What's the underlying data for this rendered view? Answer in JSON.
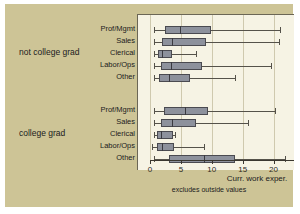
{
  "background_colors": {
    "slide": "#cdc496",
    "panel": "#f6f3e4",
    "box_fill": "#8d919c",
    "box_edge": "#4a4a50",
    "grid": "#cfc9ae",
    "axis": "#3a3730"
  },
  "groups": [
    {
      "label": "not college grad"
    },
    {
      "label": "college grad"
    }
  ],
  "categories": [
    "Prof/Mgmt",
    "Sales",
    "Clerical",
    "Labor/Ops",
    "Other"
  ],
  "axis": {
    "title": "Curr. work exper.",
    "note": "excludes outside values",
    "ticks": [
      "0",
      "5",
      "10",
      "15",
      "20"
    ],
    "tick_values": [
      0,
      5,
      10,
      15,
      20
    ],
    "min": 0,
    "max": 22.5
  },
  "chart_data": {
    "type": "box",
    "title": "",
    "xlabel": "Curr. work exper.",
    "ylabel": "",
    "subtitle": "excludes outside values",
    "xlim": [
      0,
      22.5
    ],
    "grid": true,
    "legend": "none",
    "orientation": "horizontal",
    "groups": [
      {
        "name": "not college grad",
        "boxes": [
          {
            "category": "Prof/Mgmt",
            "whisker_low": 0.6,
            "q1": 2.5,
            "median": 4.8,
            "q3": 9.8,
            "whisker_high": 21.0
          },
          {
            "category": "Sales",
            "whisker_low": 0.6,
            "q1": 1.9,
            "median": 3.5,
            "q3": 9.1,
            "whisker_high": 20.9
          },
          {
            "category": "Clerical",
            "whisker_low": 0.6,
            "q1": 1.3,
            "median": 2.0,
            "q3": 3.6,
            "whisker_high": 7.4
          },
          {
            "category": "Labor/Ops",
            "whisker_low": 0.6,
            "q1": 1.7,
            "median": 3.4,
            "q3": 8.4,
            "whisker_high": 19.6
          },
          {
            "category": "Other",
            "whisker_low": 0.6,
            "q1": 1.4,
            "median": 3.0,
            "q3": 6.4,
            "whisker_high": 13.7
          }
        ]
      },
      {
        "name": "college grad",
        "boxes": [
          {
            "category": "Prof/Mgmt",
            "whisker_low": 0.6,
            "q1": 2.2,
            "median": 5.6,
            "q3": 9.4,
            "whisker_high": 20.3
          },
          {
            "category": "Sales",
            "whisker_low": 0.6,
            "q1": 1.7,
            "median": 3.6,
            "q3": 7.5,
            "whisker_high": 15.8
          },
          {
            "category": "Clerical",
            "whisker_low": 0.6,
            "q1": 1.1,
            "median": 1.8,
            "q3": 3.8,
            "whisker_high": 4.0
          },
          {
            "category": "Labor/Ops",
            "whisker_low": 0.4,
            "q1": 1.1,
            "median": 1.9,
            "q3": 3.9,
            "whisker_high": 8.8
          },
          {
            "category": "Other",
            "whisker_low": 0.6,
            "q1": 3.0,
            "median": 8.7,
            "q3": 13.8,
            "whisker_high": 21.8
          }
        ]
      }
    ]
  }
}
